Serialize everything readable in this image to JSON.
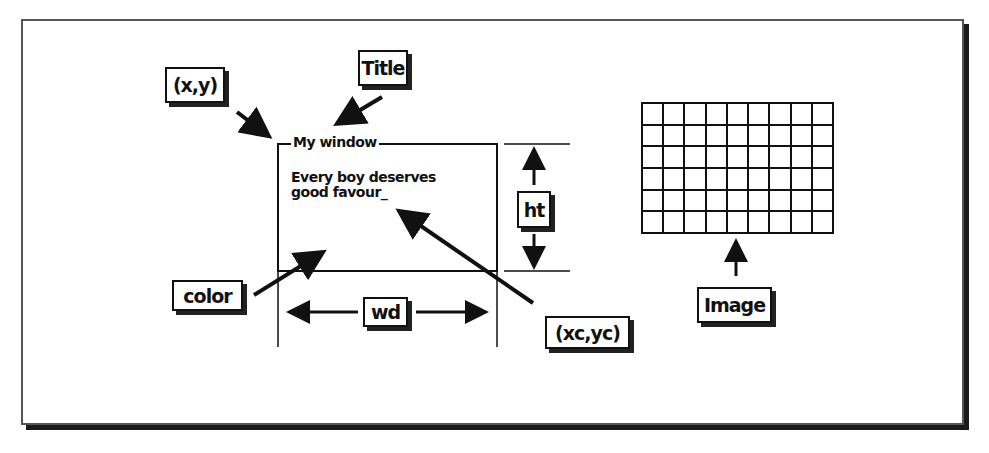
{
  "diagram": {
    "labels": {
      "xy": "(x,y)",
      "title": "Title",
      "color": "color",
      "wd": "wd",
      "ht": "ht",
      "xcyc": "(xc,yc)",
      "image": "Image"
    },
    "window": {
      "title": "My window",
      "text_line1": "Every boy deserves",
      "text_line2": "good favour_"
    },
    "image_grid": {
      "columns": 9,
      "rows": 6
    },
    "colors": {
      "ink": "#111111",
      "background": "#ffffff",
      "frame": "#555555"
    }
  }
}
